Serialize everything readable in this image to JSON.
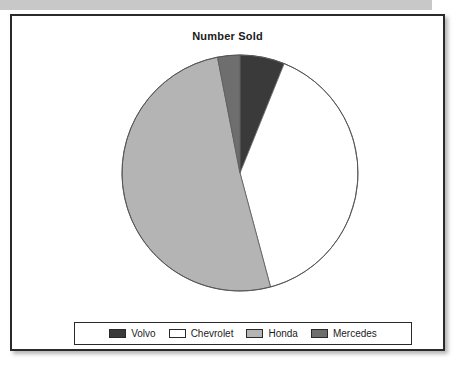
{
  "panel": {
    "title": "Number Sold"
  },
  "chart_data": {
    "type": "pie",
    "title": "Number Sold",
    "xlabel": "",
    "ylabel": "",
    "legend_position": "bottom",
    "grid": false,
    "start_angle_deg": 0,
    "direction": "clockwise",
    "categories": [
      "Volvo",
      "Chevrolet",
      "Honda",
      "Mercedes"
    ],
    "angles_deg": [
      22,
      143,
      184,
      11
    ],
    "values": [
      6.1,
      39.7,
      51.1,
      3.1
    ],
    "value_unit": "percent",
    "colors": [
      "#3a3a3a",
      "#ffffff",
      "#b4b4b4",
      "#6e6e6e"
    ],
    "slices": [
      {
        "label": "Volvo",
        "angle_deg": 22,
        "percent": 6.1,
        "color": "#3a3a3a"
      },
      {
        "label": "Chevrolet",
        "angle_deg": 143,
        "percent": 39.7,
        "color": "#ffffff"
      },
      {
        "label": "Honda",
        "angle_deg": 184,
        "percent": 51.1,
        "color": "#b4b4b4"
      },
      {
        "label": "Mercedes",
        "angle_deg": 11,
        "percent": 3.1,
        "color": "#6e6e6e"
      }
    ]
  },
  "legend": {
    "items": [
      {
        "label": "Volvo",
        "color": "#3a3a3a"
      },
      {
        "label": "Chevrolet",
        "color": "#ffffff"
      },
      {
        "label": "Honda",
        "color": "#b4b4b4"
      },
      {
        "label": "Mercedes",
        "color": "#6e6e6e"
      }
    ]
  }
}
